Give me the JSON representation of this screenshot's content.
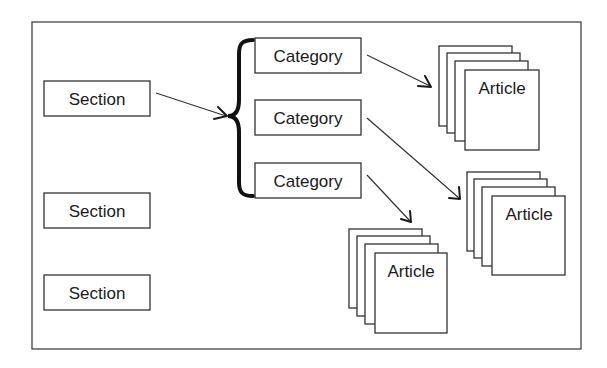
{
  "diagram": {
    "type": "hierarchy",
    "colors": {
      "stroke": "#333333",
      "brace": "#111111",
      "background": "#ffffff"
    },
    "sections": [
      {
        "label": "Section"
      },
      {
        "label": "Section"
      },
      {
        "label": "Section"
      }
    ],
    "categories": [
      {
        "label": "Category"
      },
      {
        "label": "Category"
      },
      {
        "label": "Category"
      }
    ],
    "articles": [
      {
        "label": "Article"
      },
      {
        "label": "Article"
      },
      {
        "label": "Article"
      }
    ],
    "connections": [
      {
        "from": "Section 1",
        "to": "Category group (brace)"
      },
      {
        "from": "Category 1",
        "to": "Article stack 1"
      },
      {
        "from": "Category 2",
        "to": "Article stack 2"
      },
      {
        "from": "Category 3",
        "to": "Article stack 3"
      }
    ]
  }
}
